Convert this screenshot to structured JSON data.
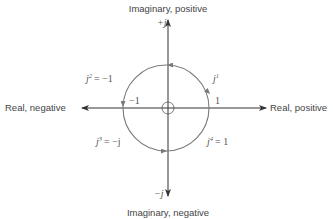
{
  "diagram": {
    "axes": {
      "imag_positive_label": "Imaginary, positive",
      "imag_negative_label": "Imaginary, negative",
      "real_positive_label": "Real, positive",
      "real_negative_label": "Real, negative",
      "plus_j": "+j",
      "minus_j": "−j"
    },
    "points": {
      "neg_one": "−1",
      "one": "1"
    },
    "powers": [
      {
        "base": "j",
        "exp": "1",
        "rhs": ""
      },
      {
        "base": "j",
        "exp": "2",
        "rhs": "= −1"
      },
      {
        "base": "j",
        "exp": "3",
        "rhs": "= −j"
      },
      {
        "base": "j",
        "exp": "4",
        "rhs": "= 1"
      }
    ],
    "colors": {
      "axis": "#333333",
      "circle": "#7a7a7a",
      "text": "#444444"
    }
  }
}
